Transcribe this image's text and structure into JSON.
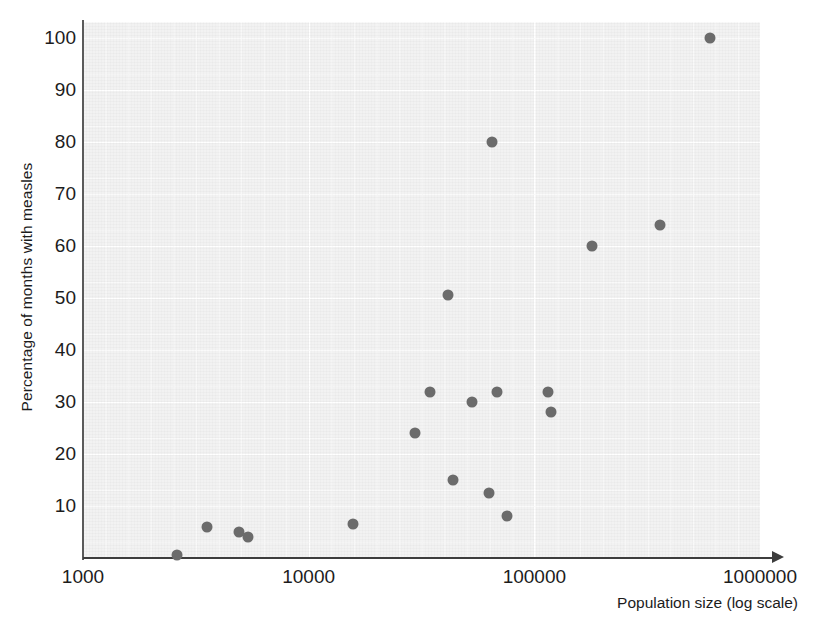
{
  "chart_data": {
    "type": "scatter",
    "title": "",
    "xlabel": "Population size (log scale)",
    "ylabel": "Percentage of months with measles",
    "xscale": "log",
    "xlim": [
      1000,
      1000000
    ],
    "ylim": [
      0,
      100
    ],
    "grid": true,
    "legend": null,
    "xtick_labels": [
      "1000",
      "10000",
      "100000",
      "1000000"
    ],
    "xticks": [
      1000,
      10000,
      100000,
      1000000
    ],
    "ytick_labels": [
      "10",
      "20",
      "30",
      "40",
      "50",
      "60",
      "70",
      "80",
      "90",
      "100"
    ],
    "yticks": [
      10,
      20,
      30,
      40,
      50,
      60,
      70,
      80,
      90,
      100
    ],
    "marker_color": "#6b6b6b",
    "panel_color": "#f2f2f2",
    "points": [
      {
        "x": 2600,
        "y": 0.5
      },
      {
        "x": 3550,
        "y": 6.0
      },
      {
        "x": 4900,
        "y": 5.0
      },
      {
        "x": 5400,
        "y": 4.0
      },
      {
        "x": 15800,
        "y": 6.5
      },
      {
        "x": 29500,
        "y": 24.0
      },
      {
        "x": 34500,
        "y": 32.0
      },
      {
        "x": 41500,
        "y": 50.5
      },
      {
        "x": 43500,
        "y": 15.0
      },
      {
        "x": 53000,
        "y": 30.0
      },
      {
        "x": 63000,
        "y": 12.5
      },
      {
        "x": 65000,
        "y": 80.0
      },
      {
        "x": 68000,
        "y": 32.0
      },
      {
        "x": 76000,
        "y": 8.0
      },
      {
        "x": 115000,
        "y": 32.0
      },
      {
        "x": 118000,
        "y": 28.0
      },
      {
        "x": 180000,
        "y": 60.0
      },
      {
        "x": 360000,
        "y": 64.0
      },
      {
        "x": 600000,
        "y": 100.0
      }
    ]
  }
}
